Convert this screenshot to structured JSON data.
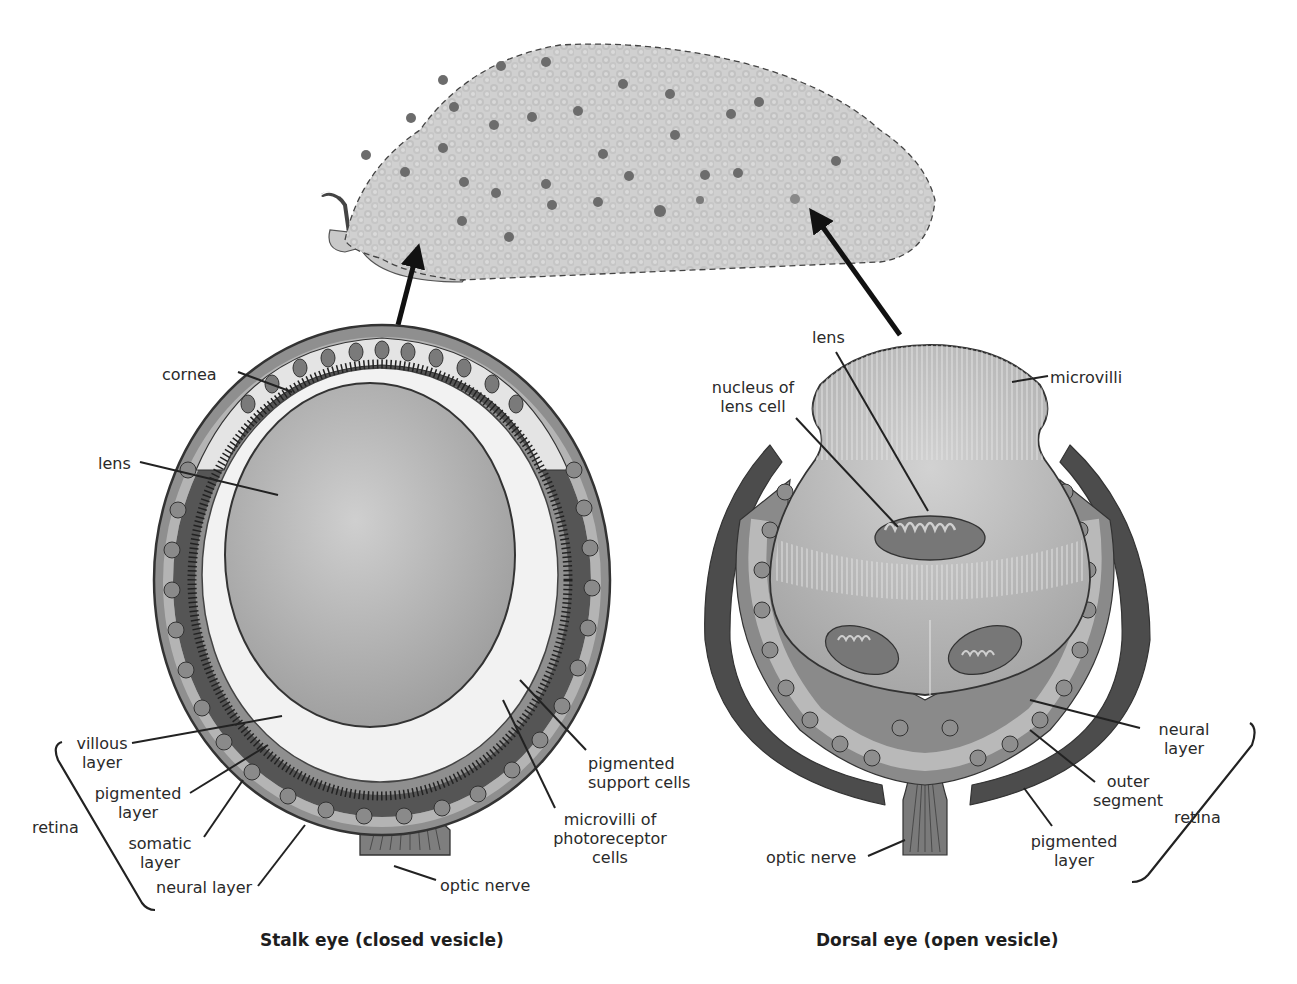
{
  "organism": {
    "description": "slug-like body covered with pale tubercles and scattered dark dorsal eyes",
    "eye_spots_count": 30
  },
  "stalk_eye": {
    "caption": "Stalk eye (closed vesicle)",
    "labels": {
      "cornea": "cornea",
      "lens": "lens",
      "villous_layer": "villous\nlayer",
      "pigmented_layer": "pigmented\nlayer",
      "somatic_layer": "somatic\nlayer",
      "neural_layer": "neural layer",
      "retina": "retina",
      "pigmented_support_cells": "pigmented\nsupport cells",
      "microvilli_photoreceptor": "microvilli of\nphotoreceptor\ncells",
      "optic_nerve": "optic nerve"
    }
  },
  "dorsal_eye": {
    "caption": "Dorsal eye (open vesicle)",
    "labels": {
      "lens": "lens",
      "nucleus": "nucleus of\nlens cell",
      "microvilli": "microvilli",
      "neural_layer": "neural\nlayer",
      "outer_segment": "outer\nsegment",
      "pigmented_layer": "pigmented\nlayer",
      "retina": "retina",
      "optic_nerve": "optic nerve"
    }
  },
  "colors": {
    "ink": "#222222",
    "body_fill": "#cfcfcf",
    "eye_spot": "#6a6a6a",
    "lens_fill": "#bdbdbd",
    "pigment_dark": "#4a4a4a",
    "cell_mid": "#8a8a8a",
    "cell_light": "#bcbcbc",
    "cell_pale": "#dcdcdc"
  }
}
